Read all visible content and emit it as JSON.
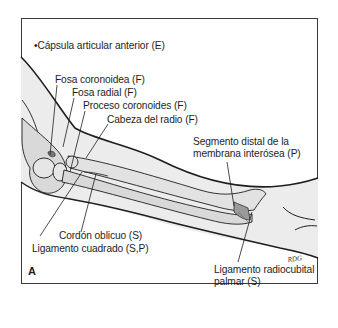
{
  "figure": {
    "panel_label": "A",
    "signature": "RDG",
    "colors": {
      "outline": "#1e1e1e",
      "limb_fill": "#ececec",
      "bone_fill": "#d9d9d9",
      "ligament_fill": "#9a9a9a"
    }
  },
  "labels": {
    "capsule": "•Cápsula articular anterior (E)",
    "coronoid_fossa": "Fosa coronoidea (F)",
    "radial_fossa": "Fosa radial (F)",
    "coronoid_process": "Proceso coronoides (F)",
    "radial_head": "Cabeza del radio (F)",
    "interosseous_line1": "Segmento distal de la",
    "interosseous_line2": "membrana interósea (P)",
    "oblique_cord": "Cordón oblicuo (S)",
    "quadrate_ligament": "Ligamento cuadrado (S,P)",
    "palmar_line1": "Ligamento radiocubital",
    "palmar_line2": "palmar (S)"
  }
}
